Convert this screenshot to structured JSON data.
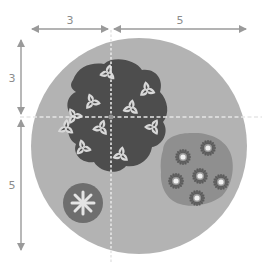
{
  "diagram": {
    "type": "planting-plan",
    "dimensions": {
      "horizontal": [
        {
          "label": "3",
          "from_x": 30,
          "to_x": 110
        },
        {
          "label": "5",
          "from_x": 113,
          "to_x": 248
        }
      ],
      "vertical": [
        {
          "label": "3",
          "from_y": 40,
          "to_y": 116
        },
        {
          "label": "5",
          "from_y": 119,
          "to_y": 250
        }
      ]
    },
    "colors": {
      "bed": "#b3b3b3",
      "dark_group": "#4d4d4d",
      "medium_group": "#8f8f8f",
      "small_plant": "#6e6e6e",
      "flower": "#d9d9d9",
      "dim_line": "#9a9a9a",
      "guide": "#e6e6e6"
    },
    "groups": [
      {
        "name": "trillium-cluster",
        "count": 11
      },
      {
        "name": "aster-cluster",
        "count": 6
      },
      {
        "name": "single-star-plant",
        "count": 1
      }
    ]
  }
}
